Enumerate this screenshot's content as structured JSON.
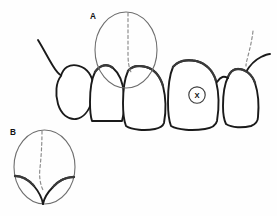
{
  "figure": {
    "background_color": "#fefefe",
    "ink_color": "#1a1a1a",
    "callout_stroke_color": "#6e6e6e",
    "dashed_line_color": "#8a8a8a",
    "width": 277,
    "height": 216
  },
  "labels": {
    "callout_a": "A",
    "callout_b": "B",
    "marker_x": "X"
  },
  "callouts": [
    {
      "id": "a",
      "label": "A",
      "shape": "ellipse",
      "cx": 126,
      "cy": 50,
      "rx": 31,
      "ry": 38,
      "label_x": 93,
      "label_y": 19,
      "has_dashed_midline": true
    },
    {
      "id": "b",
      "label": "B",
      "shape": "ellipse",
      "cx": 44.5,
      "cy": 167,
      "rx": 30.5,
      "ry": 37,
      "label_x": 13,
      "label_y": 135,
      "has_dashed_midline": true
    }
  ],
  "markers": [
    {
      "id": "x",
      "label": "X",
      "shape": "circle",
      "cx": 197,
      "cy": 95,
      "r": 8.2,
      "label_x": 197,
      "label_y": 98
    }
  ],
  "teeth": [
    {
      "id": "tooth-1",
      "name": "left-lateral",
      "position": "far-left"
    },
    {
      "id": "tooth-2",
      "name": "left-central-adjacent",
      "position": "left"
    },
    {
      "id": "tooth-3",
      "name": "left-central-incisor",
      "position": "center-left"
    },
    {
      "id": "tooth-4",
      "name": "right-central-incisor",
      "position": "center-right",
      "marked": "X"
    },
    {
      "id": "tooth-5",
      "name": "right-lateral",
      "position": "far-right"
    }
  ],
  "dashed_lines": [
    {
      "id": "midline-a",
      "description": "vertical dashed midline through callout A"
    },
    {
      "id": "midline-b",
      "description": "vertical dashed midline through callout B"
    },
    {
      "id": "right-marginal-dash",
      "description": "short dashed line at upper right gingival margin"
    }
  ]
}
